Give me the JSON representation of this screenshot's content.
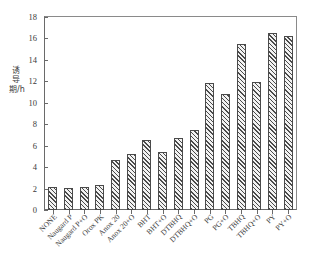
{
  "chart_data": {
    "type": "bar",
    "title": "",
    "xlabel": "",
    "ylabel": "诱导期/h",
    "ylim": [
      0,
      18
    ],
    "yticks": [
      0,
      2,
      4,
      6,
      8,
      10,
      12,
      14,
      16,
      18
    ],
    "ytick_labels": [
      "0",
      "2",
      "4",
      "6",
      "8",
      "10",
      "12",
      "14",
      "16",
      "18"
    ],
    "grid": false,
    "legend": "none",
    "categories": [
      "NONE",
      "Naugard P",
      "Naugard P+O",
      "Orox PK",
      "Anox 20",
      "Anox 20+O",
      "BHT",
      "BHT+O",
      "DTBHQ",
      "DTBHQ+O",
      "PG",
      "PG+O",
      "TBHQ",
      "TBHQ+O",
      "PY",
      "PY+O"
    ],
    "values": [
      2.1,
      2.05,
      2.15,
      2.35,
      4.65,
      5.2,
      6.5,
      5.45,
      6.7,
      7.5,
      11.8,
      10.8,
      15.5,
      11.9,
      16.55,
      16.2
    ],
    "bar_fill": "#f2f2f2",
    "bar_edge": "#4a4a4a",
    "hatch": "///",
    "axis_color": "#6a6a6a",
    "background": "#ffffff"
  }
}
